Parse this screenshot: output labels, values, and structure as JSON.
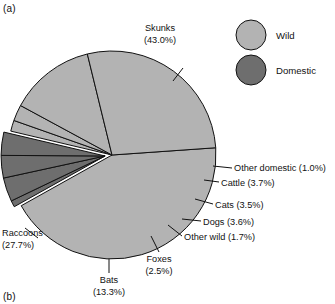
{
  "figure": {
    "panel_a_tag": "(a)",
    "panel_b_tag": "(b)"
  },
  "legend": {
    "position": "top-right",
    "items": [
      {
        "label": "Wild",
        "color": "#b3b3b3"
      },
      {
        "label": "Domestic",
        "color": "#6e6e6e"
      }
    ]
  },
  "labels": {
    "skunks": "Skunks",
    "skunks_pct": "(43.0%)",
    "raccoons": "Raccoons",
    "raccoons_pct": "(27.7%)",
    "bats": "Bats",
    "bats_pct": "(13.3%)",
    "foxes": "Foxes",
    "foxes_pct": "(2.5%)",
    "other_wild": "Other wild (1.7%)",
    "dogs": "Dogs (3.6%)",
    "cats": "Cats (3.5%)",
    "cattle": "Cattle (3.7%)",
    "other_domestic": "Other domestic (1.0%)"
  },
  "chart_data": {
    "type": "pie",
    "title": "",
    "subtitle": "",
    "xlabel": "",
    "ylabel": "",
    "grid": false,
    "legend_position": "top-right",
    "units": "percent",
    "total": 100.0,
    "groups": [
      {
        "name": "Wild",
        "color": "#b3b3b3"
      },
      {
        "name": "Domestic",
        "color": "#6e6e6e"
      }
    ],
    "categories": [
      "Skunks",
      "Other domestic",
      "Cattle",
      "Cats",
      "Dogs",
      "Other wild",
      "Foxes",
      "Bats",
      "Raccoons"
    ],
    "values": [
      43.0,
      1.0,
      3.7,
      3.5,
      3.6,
      1.7,
      2.5,
      13.3,
      27.7
    ],
    "slices": [
      {
        "label": "Skunks",
        "value": 43.0,
        "group": "Wild",
        "color": "#b3b3b3",
        "exploded": false,
        "label_text": "Skunks (43.0%)"
      },
      {
        "label": "Other domestic",
        "value": 1.0,
        "group": "Domestic",
        "color": "#6e6e6e",
        "exploded": true,
        "label_text": "Other domestic (1.0%)"
      },
      {
        "label": "Cattle",
        "value": 3.7,
        "group": "Domestic",
        "color": "#6e6e6e",
        "exploded": true,
        "label_text": "Cattle (3.7%)"
      },
      {
        "label": "Cats",
        "value": 3.5,
        "group": "Domestic",
        "color": "#6e6e6e",
        "exploded": true,
        "label_text": "Cats (3.5%)"
      },
      {
        "label": "Dogs",
        "value": 3.6,
        "group": "Domestic",
        "color": "#6e6e6e",
        "exploded": true,
        "label_text": "Dogs (3.6%)"
      },
      {
        "label": "Other wild",
        "value": 1.7,
        "group": "Wild",
        "color": "#b3b3b3",
        "exploded": false,
        "label_text": "Other wild (1.7%)"
      },
      {
        "label": "Foxes",
        "value": 2.5,
        "group": "Wild",
        "color": "#b3b3b3",
        "exploded": false,
        "label_text": "Foxes (2.5%)"
      },
      {
        "label": "Bats",
        "value": 13.3,
        "group": "Wild",
        "color": "#b3b3b3",
        "exploded": false,
        "label_text": "Bats (13.3%)"
      },
      {
        "label": "Raccoons",
        "value": 27.7,
        "group": "Wild",
        "color": "#b3b3b3",
        "exploded": false,
        "label_text": "Raccoons (27.7%)"
      }
    ]
  }
}
